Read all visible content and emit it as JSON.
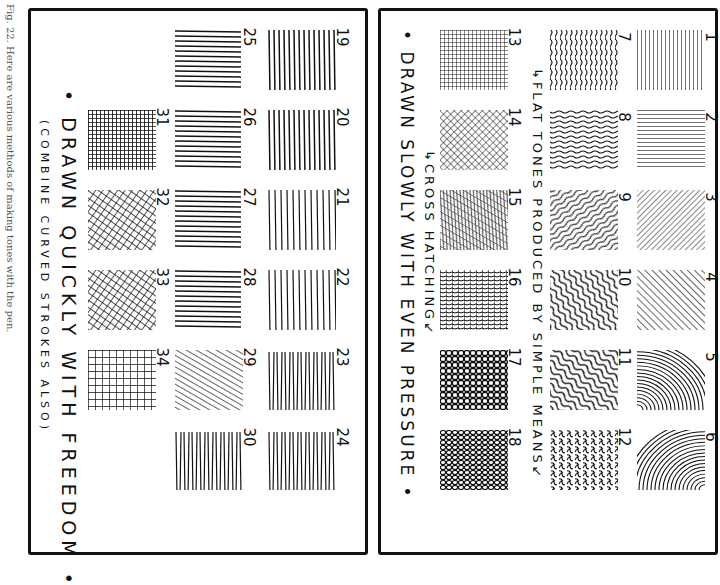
{
  "caption": "Fig. 22. Here are various methods of making tones with the pen.",
  "right_panel": {
    "label_flat": "↳FLAT TONES PRODUCED BY SIMPLE MEANS↙",
    "label_cross": "↳CROSS HATCHING↙",
    "title": "• DRAWN SLOWLY WITH EVEN PRESSURE •",
    "squares": [
      {
        "n": "1",
        "pattern": "vertical"
      },
      {
        "n": "2",
        "pattern": "horizontal"
      },
      {
        "n": "3",
        "pattern": "diag-fine"
      },
      {
        "n": "4",
        "pattern": "diag"
      },
      {
        "n": "5",
        "pattern": "arc"
      },
      {
        "n": "6",
        "pattern": "arc2"
      },
      {
        "n": "7",
        "pattern": "wavy-v"
      },
      {
        "n": "8",
        "pattern": "wavy-h"
      },
      {
        "n": "9",
        "pattern": "wavy-diag"
      },
      {
        "n": "10",
        "pattern": "wavy-diag2"
      },
      {
        "n": "11",
        "pattern": "swirl"
      },
      {
        "n": "12",
        "pattern": "squiggle"
      },
      {
        "n": "13",
        "pattern": "grid"
      },
      {
        "n": "14",
        "pattern": "crossdiag"
      },
      {
        "n": "15",
        "pattern": "crossdiag2"
      },
      {
        "n": "16",
        "pattern": "crosswave"
      },
      {
        "n": "17",
        "pattern": "cells"
      },
      {
        "n": "18",
        "pattern": "cells2"
      }
    ]
  },
  "left_panel": {
    "title": "• DRAWN QUICKLY WITH FREEDOM •",
    "subtitle": "(COMBINE CURVED STROKES ALSO)",
    "squares": [
      {
        "n": "19",
        "pattern": "q-vertical"
      },
      {
        "n": "20",
        "pattern": "q-vertical2"
      },
      {
        "n": "21",
        "pattern": "q-hook"
      },
      {
        "n": "22",
        "pattern": "q-curve"
      },
      {
        "n": "23",
        "pattern": "q-zigzag"
      },
      {
        "n": "24",
        "pattern": "q-zigzag2"
      },
      {
        "n": "25",
        "pattern": "q-horizontal"
      },
      {
        "n": "26",
        "pattern": "q-horizontal2"
      },
      {
        "n": "27",
        "pattern": "q-horizontal3"
      },
      {
        "n": "28",
        "pattern": "q-horizontal4"
      },
      {
        "n": "29",
        "pattern": "q-diag"
      },
      {
        "n": "30",
        "pattern": "q-zigzag3"
      },
      {
        "n": "31",
        "pattern": "q-grid-dense"
      },
      {
        "n": "32",
        "pattern": "q-crossdiag"
      },
      {
        "n": "33",
        "pattern": "q-crossdiag2"
      },
      {
        "n": "34",
        "pattern": "q-grid"
      }
    ]
  }
}
